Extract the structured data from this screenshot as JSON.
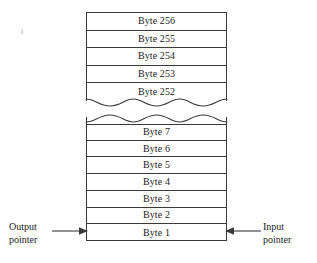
{
  "figure": {
    "kind": "circular-buffer-diagram",
    "colors": {
      "stroke": "#3a3a3a",
      "text": "#1a1a1a",
      "background": "#ffffff"
    }
  },
  "upper_buffer": {
    "name": "high-address-bytes",
    "cells": [
      {
        "label": "Byte 256"
      },
      {
        "label": "Byte 255"
      },
      {
        "label": "Byte 254"
      },
      {
        "label": "Byte 253"
      },
      {
        "label": "Byte 252"
      }
    ]
  },
  "lower_buffer": {
    "name": "low-address-bytes",
    "cells": [
      {
        "label": "Byte 7"
      },
      {
        "label": "Byte 6"
      },
      {
        "label": "Byte 5"
      },
      {
        "label": "Byte 4"
      },
      {
        "label": "Byte 3"
      },
      {
        "label": "Byte 2"
      },
      {
        "label": "Byte 1"
      }
    ]
  },
  "pointers": {
    "output": {
      "line1": "Output",
      "line2": "pointer",
      "direction": "right",
      "target_cell": "Byte 1"
    },
    "input": {
      "line1": "Input",
      "line2": "pointer",
      "direction": "left",
      "target_cell": "Byte 1"
    }
  }
}
